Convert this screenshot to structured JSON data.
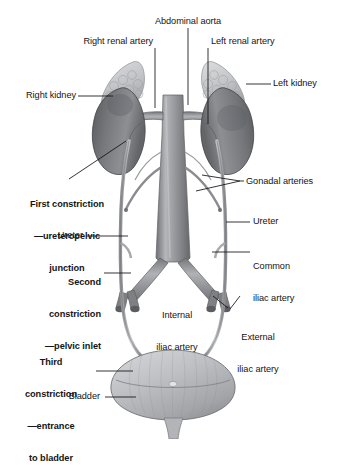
{
  "figure": {
    "background_color": "#ffffff",
    "line_color": "#111111",
    "organ_fill_dark": "#6f7175",
    "organ_fill_mid": "#9a9ca0",
    "organ_fill_light": "#c9cbce",
    "vessel_fill": "#8a8d91",
    "bladder_fill": "#b9bbbe",
    "adrenal_fill": "#c3c5c8"
  },
  "labels": {
    "abdominal_aorta": "Abdominal aorta",
    "right_renal_artery": "Right renal artery",
    "left_renal_artery": "Left renal artery",
    "right_kidney": "Right kidney",
    "left_kidney": "Left kidney",
    "first_constriction_line1": "First constriction",
    "first_constriction_line2": "—ureteropelvic",
    "first_constriction_line3": "junction",
    "gonadal_arteries": "Gonadal arteries",
    "ureter_left": "Ureter",
    "ureter_right": "Ureter",
    "common_iliac_line1": "Common",
    "common_iliac_line2": "iliac artery",
    "second_constriction_line1": "Second",
    "second_constriction_line2": "constriction",
    "second_constriction_line3": "—pelvic inlet",
    "internal_iliac_line1": "Internal",
    "internal_iliac_line2": "iliac artery",
    "external_iliac_line1": "External",
    "external_iliac_line2": "iliac artery",
    "third_constriction_line1": "Third",
    "third_constriction_line2": "constriction",
    "third_constriction_line3": "—entrance",
    "third_constriction_line4": "to bladder",
    "bladder": "Bladder"
  },
  "structures": [
    {
      "name": "right-adrenal-gland",
      "side": "right"
    },
    {
      "name": "left-adrenal-gland",
      "side": "left"
    },
    {
      "name": "right-kidney",
      "side": "right"
    },
    {
      "name": "left-kidney",
      "side": "left"
    },
    {
      "name": "abdominal-aorta",
      "side": "center"
    },
    {
      "name": "right-renal-artery",
      "side": "right"
    },
    {
      "name": "left-renal-artery",
      "side": "left"
    },
    {
      "name": "right-gonadal-artery",
      "side": "right"
    },
    {
      "name": "left-gonadal-artery",
      "side": "left"
    },
    {
      "name": "right-common-iliac-artery",
      "side": "right"
    },
    {
      "name": "left-common-iliac-artery",
      "side": "left"
    },
    {
      "name": "right-internal-iliac-artery",
      "side": "right"
    },
    {
      "name": "left-internal-iliac-artery",
      "side": "left"
    },
    {
      "name": "right-external-iliac-artery",
      "side": "right"
    },
    {
      "name": "left-external-iliac-artery",
      "side": "left"
    },
    {
      "name": "right-ureter",
      "side": "right"
    },
    {
      "name": "left-ureter",
      "side": "left"
    },
    {
      "name": "urinary-bladder",
      "side": "center"
    },
    {
      "name": "urethra",
      "side": "center"
    }
  ]
}
